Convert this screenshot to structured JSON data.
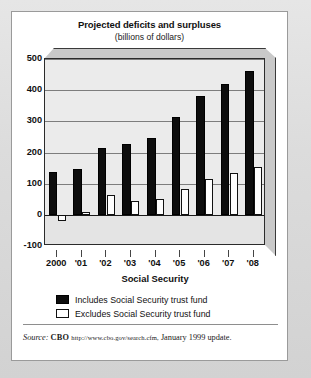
{
  "figure": {
    "title": "Projected deficits and surpluses",
    "subtitle": "(billions of dollars)"
  },
  "source": {
    "label": "Source:",
    "org": "CBO",
    "url": "http://www.cbo.gov/search.cfm,",
    "note": "January 1999 update."
  },
  "chart_data": {
    "type": "bar",
    "title": "Projected deficits and surpluses",
    "subtitle": "(billions of dollars)",
    "xlabel": "Social Security",
    "ylabel": "",
    "ylim": [
      -100,
      500
    ],
    "yticks": [
      500,
      400,
      300,
      200,
      100,
      0,
      -100
    ],
    "ytick_labels": [
      "500",
      "400",
      "300",
      "200",
      "100",
      "0",
      "-100"
    ],
    "grid": true,
    "legend_position": "bottom",
    "categories": [
      "2000",
      "'01",
      "'02",
      "'03",
      "'04",
      "'05",
      "'06",
      "'07",
      "'08"
    ],
    "series": [
      {
        "name": "Includes Social Security trust fund",
        "color": "#0d0d0d",
        "values": [
          137,
          147,
          213,
          227,
          246,
          313,
          381,
          420,
          461
        ]
      },
      {
        "name": "Excludes Social Security trust fund",
        "color": "#ffffff",
        "values": [
          -21,
          8,
          65,
          45,
          51,
          82,
          115,
          133,
          154
        ]
      }
    ]
  }
}
